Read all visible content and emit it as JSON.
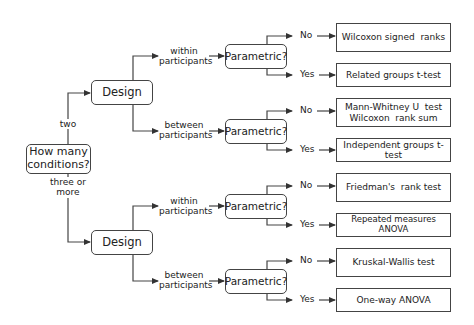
{
  "root": {
    "label_line1": "How many",
    "label_line2": "conditions?"
  },
  "branches": {
    "two": "two",
    "three_line1": "three or",
    "three_line2": "more"
  },
  "design_label": "Design",
  "parametric_label": "Parametric?",
  "within_line1": "within",
  "between_line1": "between",
  "participants": "participants",
  "no": "No",
  "yes": "Yes",
  "results": {
    "two_within_no": "Wilcoxon signed  ranks",
    "two_within_yes": "Related groups t-test",
    "two_between_no_line1": "Mann-Whitney U  test",
    "two_between_no_line2": "Wilcoxon  rank sum",
    "two_between_yes": "Independent groups t-test",
    "three_within_no": "Friedman's  rank test",
    "three_within_yes": "Repeated measures ANOVA",
    "three_between_no": "Kruskal-Wallis test",
    "three_between_yes": "One-way ANOVA"
  },
  "colors": {
    "line": "#444444",
    "text": "#222222",
    "background": "#ffffff"
  }
}
